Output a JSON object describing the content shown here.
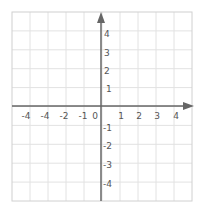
{
  "diagram": {
    "type": "coordinate-plane",
    "grid": {
      "cols": 10,
      "rows": 10,
      "line_color": "#e2e2e2",
      "border_color": "#d0d0d0"
    },
    "axis_color": "#666666",
    "label_color": "#555555",
    "x_axis": {
      "labels_left": [
        "-4",
        "-4",
        "-2",
        "-1"
      ],
      "origin": "0",
      "labels_right": [
        "1",
        "2",
        "3",
        "4"
      ]
    },
    "y_axis": {
      "labels_top": [
        "4",
        "3",
        "2",
        "1"
      ],
      "labels_bottom": [
        "-1",
        "-2",
        "-3",
        "-4"
      ]
    }
  }
}
